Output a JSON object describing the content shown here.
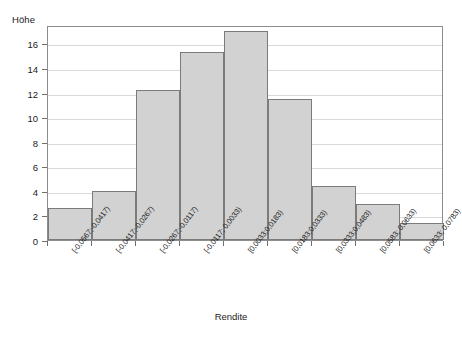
{
  "chart_data": {
    "type": "bar",
    "title": "",
    "xlabel": "Rendite",
    "ylabel": "Höhe",
    "ylim": [
      0,
      17.5
    ],
    "yticks": [
      0,
      2,
      4,
      6,
      8,
      10,
      12,
      14,
      16
    ],
    "grid": true,
    "legend": null,
    "bar_fill_color": "#d2d2d2",
    "bar_edge_color": "#7b7b7b",
    "axis_color": "#8d8d8d",
    "gridline_color": "#d9d9d9",
    "categories": [
      "[-0,0567;-0,0417)",
      "[-0,0417;-0,0267)",
      "[-0,0267;-0,0117)",
      "[-0,0117; 0,0033)",
      "[0,0033;0,0183)",
      "[0,0183;0,0333)",
      "[0,0333;0,0483)",
      "[0,0583; 0,0633)",
      "[0,0633; 0,0783)"
    ],
    "values": [
      2.6,
      4.0,
      12.2,
      15.3,
      17.0,
      11.5,
      4.4,
      2.9,
      1.4
    ]
  }
}
